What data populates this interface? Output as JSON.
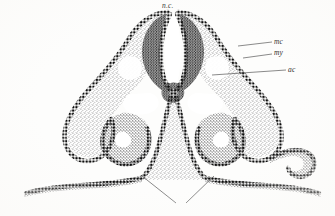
{
  "figure": {
    "kind": "histological-cross-section-illustration",
    "background_color": "#fdfdfc",
    "ink_color": "#1a1a1a",
    "stipple_color": "#3a3a3a"
  },
  "labels": [
    {
      "id": "nc",
      "text": "n.c.",
      "x": 162,
      "y": 2,
      "has_leader": false
    },
    {
      "id": "mc",
      "text": "mc",
      "x": 274,
      "y": 38,
      "has_leader": true
    },
    {
      "id": "my",
      "text": "my",
      "x": 274,
      "y": 49,
      "has_leader": true
    },
    {
      "id": "ac",
      "text": "ac",
      "x": 288,
      "y": 66,
      "has_leader": true
    }
  ],
  "leader_lines": [
    {
      "id": "leader-mc",
      "x1": 238,
      "y1": 46,
      "x2": 272,
      "y2": 42
    },
    {
      "id": "leader-my",
      "x1": 243,
      "y1": 58,
      "x2": 272,
      "y2": 54
    },
    {
      "id": "leader-ac",
      "x1": 212,
      "y1": 75,
      "x2": 286,
      "y2": 70
    },
    {
      "id": "leader-bottom-left",
      "x1": 142,
      "y1": 176,
      "x2": 176,
      "y2": 203
    },
    {
      "id": "leader-bottom-right",
      "x1": 214,
      "y1": 176,
      "x2": 186,
      "y2": 203
    }
  ],
  "structures": [
    {
      "id": "neural-canal",
      "note": "central cleft, open dorsally"
    },
    {
      "id": "dorsal-crest-left",
      "note": "dark stippled epithelium"
    },
    {
      "id": "dorsal-crest-right",
      "note": "dark stippled epithelium"
    },
    {
      "id": "lateral-wing-left",
      "note": "arching limb to left lobe"
    },
    {
      "id": "lateral-wing-right",
      "note": "arching limb to right lobe"
    },
    {
      "id": "lobe-left",
      "note": "rounded vesicle, lower left"
    },
    {
      "id": "lobe-right",
      "note": "rounded vesicle with hooked tip, lower right"
    },
    {
      "id": "notochord",
      "note": "small round cluster, midline"
    },
    {
      "id": "ventral-band-left",
      "note": "horizontal ectodermal sheet"
    },
    {
      "id": "ventral-band-right",
      "note": "horizontal ectodermal sheet"
    },
    {
      "id": "midline-stalk",
      "note": "ventral column descending to base"
    }
  ]
}
